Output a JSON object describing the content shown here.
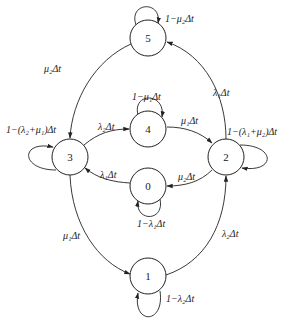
{
  "diagram": {
    "type": "state-transition",
    "nodes": [
      {
        "id": "5",
        "label": "5"
      },
      {
        "id": "4",
        "label": "4"
      },
      {
        "id": "3",
        "label": "3"
      },
      {
        "id": "2",
        "label": "2"
      },
      {
        "id": "0",
        "label": "0"
      },
      {
        "id": "1",
        "label": "1"
      }
    ],
    "edges": [
      {
        "from": "5",
        "to": "5",
        "label": "1−μ₂Δt"
      },
      {
        "from": "5",
        "to": "3",
        "label": "μ₂Δt"
      },
      {
        "from": "2",
        "to": "5",
        "label": "λ₁Δt"
      },
      {
        "from": "4",
        "to": "4",
        "label": "1−μ₁Δt"
      },
      {
        "from": "3",
        "to": "4",
        "label": "λ₂Δt"
      },
      {
        "from": "4",
        "to": "2",
        "label": "μ₁Δt"
      },
      {
        "from": "3",
        "to": "3",
        "label": "1−(λ₂+μ₁)Δt"
      },
      {
        "from": "2",
        "to": "2",
        "label": "1−(λ₁+μ₂)Δt"
      },
      {
        "from": "0",
        "to": "3",
        "label": "λ₁Δt"
      },
      {
        "from": "2",
        "to": "0",
        "label": "μ₂Δt"
      },
      {
        "from": "0",
        "to": "0",
        "label": "1−λ₁Δt"
      },
      {
        "from": "3",
        "to": "1",
        "label": "μ₁Δt"
      },
      {
        "from": "1",
        "to": "2",
        "label": "λ₂Δt"
      },
      {
        "from": "1",
        "to": "1",
        "label": "1−λ₂Δt"
      }
    ]
  }
}
